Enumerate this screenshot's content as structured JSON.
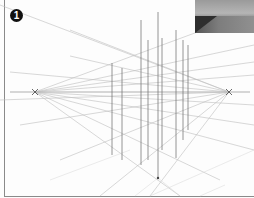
{
  "figure": {
    "badge_label": "1",
    "horizon_y": 92,
    "vanishing_points": [
      {
        "name": "left",
        "x": 35,
        "y": 92
      },
      {
        "name": "right",
        "x": 229,
        "y": 92
      }
    ],
    "vertical_lines_x": [
      112,
      122,
      141,
      148,
      162,
      176,
      183,
      188,
      191
    ],
    "bottom_point": {
      "x": 158,
      "y": 178
    },
    "colors": {
      "line": "#777777",
      "light_line": "#c8c8c8",
      "frame": "#8a8a8a",
      "badge": "#111111"
    }
  },
  "photo_thumbnail": {
    "tone": "grayscale"
  }
}
